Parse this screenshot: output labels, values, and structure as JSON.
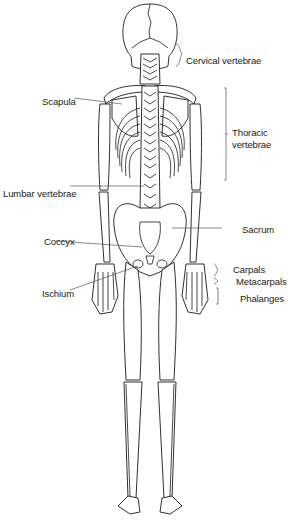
{
  "diagram": {
    "type": "anatomical-illustration",
    "labels": {
      "cervical_vertebrae": "Cervical vertebrae",
      "scapula": "Scapula",
      "thoracic_vertebrae_line1": "Thoracic",
      "thoracic_vertebrae_line2": "vertebrae",
      "lumbar_vertebrae": "Lumbar vertebrae",
      "sacrum": "Sacrum",
      "coccyx": "Coccyx",
      "carpals": "Carpals",
      "metacarpals": "Metacarpals",
      "ischium": "Ischium",
      "phalanges": "Phalanges"
    },
    "colors": {
      "line": "#1a1a1a",
      "background": "#ffffff"
    }
  }
}
